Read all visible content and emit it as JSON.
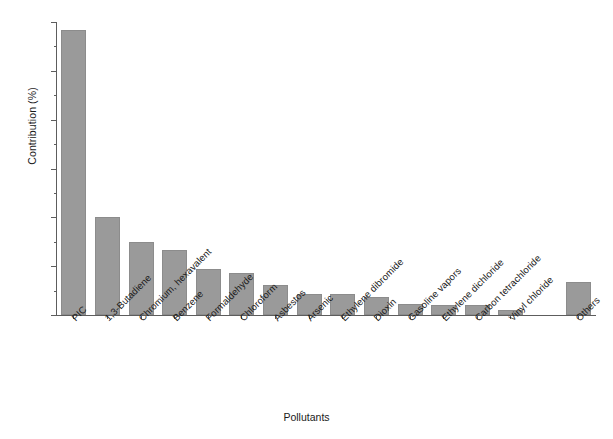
{
  "chart_data": {
    "type": "bar",
    "title": "",
    "xlabel": "Pollutants",
    "ylabel": "Contribution (%)",
    "ylim": [
      0,
      36
    ],
    "ytick_values": [
      0,
      6,
      12,
      18,
      24,
      30,
      36
    ],
    "ytick_labels": [
      "0",
      "6",
      "12",
      "18",
      "24",
      "30",
      "36"
    ],
    "yminor_step": 3,
    "grid": false,
    "legend": null,
    "bar_color": "#9a9a9a",
    "bar_edge_color": "#8c8c8c",
    "axis_color": "#5d5d5d",
    "categories": [
      "PIC",
      "1,3-Butadiene",
      "Chromium, hexavalent",
      "Benzene",
      "Formaldehyde",
      "Chloroform",
      "Asbestos",
      "Arsenic",
      "Ethylene dibromide",
      "Dioxin",
      "Gasoline vapors",
      "Ethylene dichloride",
      "Carbon tetrachloride",
      "Vinyl chloride",
      "Others"
    ],
    "values": [
      35.0,
      12.0,
      9.0,
      8.0,
      5.6,
      5.2,
      3.7,
      2.6,
      2.6,
      2.2,
      1.3,
      1.2,
      1.2,
      0.6,
      4.0
    ]
  },
  "axis": {
    "x_title": "Pollutants",
    "y_title": "Contribution (%)"
  },
  "caption": {
    "text": ""
  }
}
